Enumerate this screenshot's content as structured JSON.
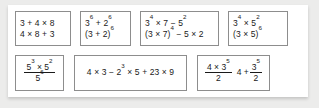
{
  "worksheet": {
    "row1": {
      "box1": {
        "line1": "3 + 4 × 8",
        "line2": "4 × 8 + 3"
      },
      "box2": {
        "line1_base1": "3",
        "line1_exp1": "6",
        "line1_mid": " + ",
        "line1_base2": "2",
        "line1_exp2": "6",
        "line2_base": "(3 + 2)",
        "line2_exp": "6"
      },
      "box3": {
        "line1_a": "3",
        "line1_a_exp": "4",
        "line1_b": " × 7 − 5",
        "line1_b_exp": "2",
        "line2_a": "(3 × 7)",
        "line2_a_exp": "4",
        "line2_b": " − 5 × 2"
      },
      "box4": {
        "line1_a": "3",
        "line1_a_exp": "4",
        "line1_b": " × 5",
        "line1_b_exp": "2",
        "line2_a": "(3 × 5)",
        "line2_a_exp": "6"
      }
    },
    "row2": {
      "box5": {
        "num_a": "5",
        "num_a_exp": "3",
        "num_b": " × 5",
        "num_b_exp": "2",
        "den": "5",
        "den_exp": "6"
      },
      "box6": {
        "part_a": "4 × 3 − 2",
        "part_a_exp": "3",
        "part_b": " × 5 + 23 × 9"
      },
      "box7": {
        "expr1_num_a": "4 × 3",
        "expr1_num_exp": "5",
        "expr1_den": "2",
        "expr2_lead": "4 + ",
        "expr2_num": "3",
        "expr2_num_exp": "5",
        "expr2_den": "2"
      }
    }
  }
}
